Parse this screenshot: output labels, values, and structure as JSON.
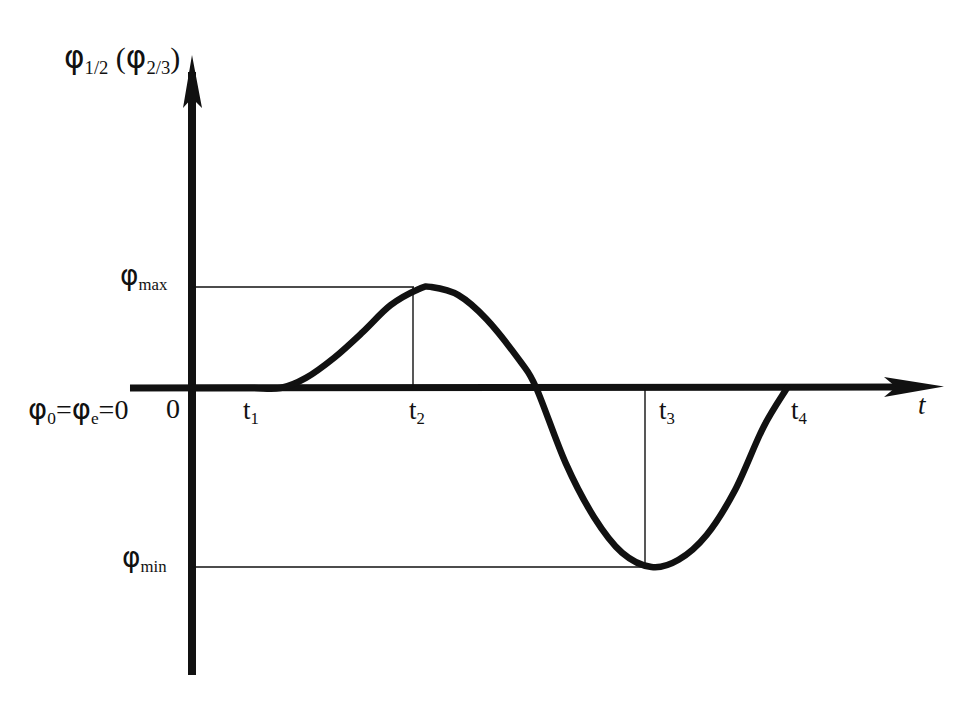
{
  "figure": {
    "background_color": "#ffffff",
    "ink_color": "#111111",
    "y_axis_label": {
      "symbol": "φ",
      "sub": "1/2",
      "paren_symbol": "φ",
      "paren_sub": "2/3",
      "text": "φ₁⁄₂ (φ₂⁄₃)"
    },
    "t_axis_label": "t",
    "origin_equation": "φ₀=φₑ=0",
    "origin_marker": "0",
    "phi_max_label": {
      "symbol": "φ",
      "sub": "max"
    },
    "phi_min_label": {
      "symbol": "φ",
      "sub": "min"
    },
    "tick_labels": [
      {
        "symbol": "t",
        "sub": "1"
      },
      {
        "symbol": "t",
        "sub": "2"
      },
      {
        "symbol": "t",
        "sub": "3"
      },
      {
        "symbol": "t",
        "sub": "4"
      }
    ]
  },
  "chart_data": {
    "type": "line",
    "title": "",
    "subtitle": "",
    "xlabel": "t",
    "ylabel": "φ₁⁄₂ (φ₂⁄₃)",
    "grid": false,
    "legend": "none",
    "axis_style": "arrow-terminated",
    "xlim": [
      0,
      1
    ],
    "ylim": [
      -1.12,
      1.12
    ],
    "x_tick_labels": [
      "t₁",
      "t₂",
      "t₃",
      "t₄"
    ],
    "x_tick_values": [
      0.155,
      0.422,
      0.812,
      1.052
    ],
    "y_tick_labels": [
      "φₘₐₓ",
      "0",
      "φₘᵢₙ"
    ],
    "y_tick_values": [
      1.0,
      0.0,
      -1.0
    ],
    "annotations": [
      {
        "label": "φ₀=φₑ=0",
        "x": 0.0,
        "y": 0.0
      },
      {
        "label": "0",
        "x": 0.0,
        "y": 0.0
      },
      {
        "label": "φₘₐₓ",
        "x": 0.422,
        "y": 1.0
      },
      {
        "label": "φₘᵢₙ",
        "x": 0.812,
        "y": -1.0
      }
    ],
    "reference_lines": [
      {
        "type": "horizontal",
        "from_x": 0.0,
        "to_x": 0.422,
        "y": 1.0,
        "label": "φₘₐₓ"
      },
      {
        "type": "vertical",
        "x": 0.422,
        "from_y": 0.0,
        "to_y": 1.0,
        "label": "t₂"
      },
      {
        "type": "horizontal",
        "from_x": 0.0,
        "to_x": 0.812,
        "y": -1.0,
        "label": "φₘᵢₙ"
      },
      {
        "type": "vertical",
        "x": 0.812,
        "from_y": 0.0,
        "to_y": -1.0,
        "label": "t₃"
      }
    ],
    "series": [
      {
        "name": "φ₁⁄₂ (φ₂⁄₃)",
        "x": [
          0.0,
          0.1,
          0.155,
          0.2,
          0.25,
          0.3,
          0.35,
          0.4,
          0.422,
          0.47,
          0.52,
          0.58,
          0.608,
          0.66,
          0.71,
          0.76,
          0.812,
          0.86,
          0.91,
          0.96,
          1.01,
          1.052
        ],
        "values": [
          0.0,
          0.0,
          0.0,
          0.1,
          0.3,
          0.55,
          0.82,
          0.98,
          1.0,
          0.92,
          0.68,
          0.26,
          0.0,
          -0.42,
          -0.72,
          -0.92,
          -1.0,
          -0.96,
          -0.82,
          -0.57,
          -0.22,
          0.0
        ]
      }
    ]
  }
}
